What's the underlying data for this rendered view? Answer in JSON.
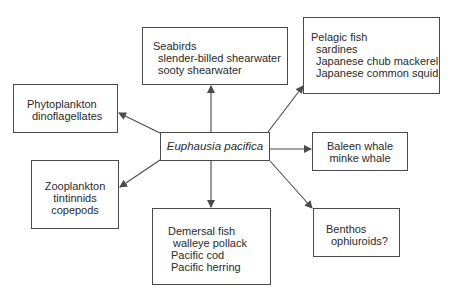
{
  "center": {
    "label": "Euphausia pacifica"
  },
  "nodes": {
    "seabirds": {
      "title": "Seabirds",
      "items": [
        "slender-billed shearwater",
        "sooty shearwater"
      ]
    },
    "pelagic": {
      "title": "Pelagic fish",
      "items": [
        "sardines",
        "Japanese chub mackerel",
        "Japanese common squid"
      ]
    },
    "phyto": {
      "title": "Phytoplankton",
      "items": [
        "dinoflagellates"
      ]
    },
    "baleen": {
      "title": "Baleen whale",
      "items": [
        "minke whale"
      ]
    },
    "zoo": {
      "title": "Zooplankton",
      "items": [
        "tintinnids",
        "copepods"
      ]
    },
    "demersal": {
      "title": "Demersal fish",
      "items": [
        "walleye pollack",
        "Pacific cod",
        "Pacific herring"
      ]
    },
    "benthos": {
      "title": "Benthos",
      "items": [
        "ophiuroids?"
      ]
    }
  },
  "colors": {
    "line": "#4a4a4a",
    "text": "#2a2a2a",
    "background": "#ffffff"
  }
}
